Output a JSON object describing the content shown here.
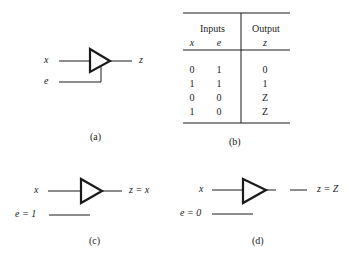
{
  "panels": {
    "a": {
      "caption": "(a)",
      "input_x_label": "x",
      "input_e_label": "e",
      "output_label": "z"
    },
    "b": {
      "caption": "(b)",
      "table": {
        "group_headers": [
          "Inputs",
          "Output"
        ],
        "columns": [
          "x",
          "e",
          "z"
        ],
        "rows": [
          [
            "0",
            "1",
            "0"
          ],
          [
            "1",
            "1",
            "1"
          ],
          [
            "0",
            "0",
            "Z"
          ],
          [
            "1",
            "0",
            "Z"
          ]
        ]
      }
    },
    "c": {
      "caption": "(c)",
      "input_x_label": "x",
      "input_e_label": "e = 1",
      "output_label": "z = x"
    },
    "d": {
      "caption": "(d)",
      "input_x_label": "x",
      "input_e_label": "e = 0",
      "output_label": "z = Z"
    }
  },
  "colors": {
    "ink": "#1a1a1a",
    "background": "#ffffff"
  }
}
